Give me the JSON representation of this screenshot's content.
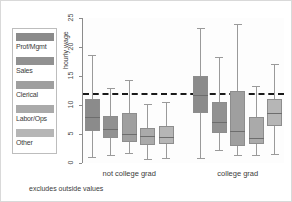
{
  "chart_data": {
    "type": "box",
    "title": "",
    "xlabel": "",
    "ylabel": "hourly wage",
    "ylim": [
      0,
      25
    ],
    "yticks": [
      0,
      5,
      10,
      15,
      20,
      25
    ],
    "grid": false,
    "note": "excludes outside values",
    "reference_line": {
      "value": 12,
      "style": "dashed",
      "color": "#1a1a1a"
    },
    "legend": {
      "position": "left-outside",
      "entries": [
        {
          "label": "Prof/Mgmt",
          "color": "#8b8b8b"
        },
        {
          "label": "Sales",
          "color": "#919191"
        },
        {
          "label": "Clerical",
          "color": "#9f9f9f"
        },
        {
          "label": "Labor/Ops",
          "color": "#aaaaaa"
        },
        {
          "label": "Other",
          "color": "#b6b6b6"
        }
      ]
    },
    "groups": [
      {
        "label": "not college grad",
        "boxes": [
          {
            "series": "Prof/Mgmt",
            "color": "#8b8b8b",
            "whisker_low": 1.1,
            "q1": 5.5,
            "median": 8.0,
            "q3": 11.1,
            "whisker_high": 18.6
          },
          {
            "series": "Sales",
            "color": "#919191",
            "whisker_low": 1.3,
            "q1": 4.3,
            "median": 5.9,
            "q3": 8.1,
            "whisker_high": 13.0
          },
          {
            "series": "Clerical",
            "color": "#9f9f9f",
            "whisker_low": 1.8,
            "q1": 3.7,
            "median": 5.0,
            "q3": 8.7,
            "whisker_high": 14.3
          },
          {
            "series": "Labor/Ops",
            "color": "#aaaaaa",
            "whisker_low": 0.7,
            "q1": 3.1,
            "median": 4.6,
            "q3": 6.0,
            "whisker_high": 10.2
          },
          {
            "series": "Other",
            "color": "#b6b6b6",
            "whisker_low": 0.8,
            "q1": 3.2,
            "median": 4.5,
            "q3": 6.4,
            "whisker_high": 10.5
          }
        ]
      },
      {
        "label": "college grad",
        "boxes": [
          {
            "series": "Prof/Mgmt",
            "color": "#8b8b8b",
            "whisker_low": 0.8,
            "q1": 8.7,
            "median": 11.7,
            "q3": 15.0,
            "whisker_high": 23.2
          },
          {
            "series": "Sales",
            "color": "#919191",
            "whisker_low": 2.3,
            "q1": 5.2,
            "median": 7.1,
            "q3": 10.5,
            "whisker_high": 18.3
          },
          {
            "series": "Clerical",
            "color": "#9f9f9f",
            "whisker_low": 1.4,
            "q1": 2.9,
            "median": 5.5,
            "q3": 12.4,
            "whisker_high": 23.9
          },
          {
            "series": "Labor/Ops",
            "color": "#aaaaaa",
            "whisker_low": 1.4,
            "q1": 3.2,
            "median": 4.3,
            "q3": 7.9,
            "whisker_high": 13.3
          },
          {
            "series": "Other",
            "color": "#b6b6b6",
            "whisker_low": 1.6,
            "q1": 6.4,
            "median": 8.6,
            "q3": 11.1,
            "whisker_high": 17.0
          }
        ]
      }
    ]
  }
}
